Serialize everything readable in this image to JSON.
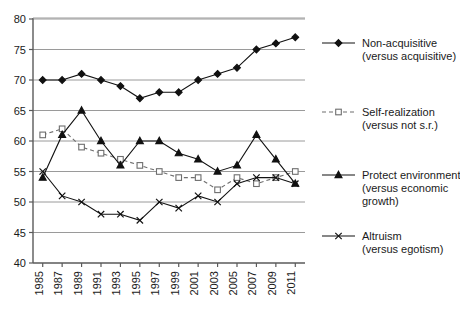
{
  "chart_data": {
    "type": "line",
    "title": "",
    "xlabel": "",
    "ylabel": "",
    "ylim": [
      40,
      80
    ],
    "ytick_step": 5,
    "yticks": [
      40,
      45,
      50,
      55,
      60,
      65,
      70,
      75,
      80
    ],
    "grid": true,
    "legend_position": "right",
    "categories": [
      1985,
      1987,
      1989,
      1991,
      1993,
      1995,
      1997,
      1999,
      2001,
      2003,
      2005,
      2007,
      2009,
      2011
    ],
    "xtick_labels": [
      "1985",
      "1987",
      "1989",
      "1991",
      "1993",
      "1995",
      "1997",
      "1999",
      "2001",
      "2003",
      "2005",
      "2007",
      "2009",
      "2011"
    ],
    "series": [
      {
        "name": "Non-acquisitive",
        "sublabel": "(versus acquisitive)",
        "marker": "filled-diamond",
        "linestyle": "solid",
        "color": "#111111",
        "values": [
          70,
          70,
          71,
          70,
          69,
          67,
          68,
          68,
          70,
          71,
          72,
          75,
          76,
          77
        ]
      },
      {
        "name": "Self-realization",
        "sublabel": "(versus not s.r.)",
        "marker": "open-square",
        "linestyle": "dashed",
        "color": "#6e6e6e",
        "values": [
          61,
          62,
          59,
          58,
          57,
          56,
          55,
          54,
          54,
          52,
          54,
          53,
          54,
          55
        ]
      },
      {
        "name": "Protect environment",
        "sublabel": "(versus economic growth)",
        "marker": "filled-triangle",
        "linestyle": "solid",
        "color": "#111111",
        "values": [
          54,
          61,
          65,
          60,
          56,
          60,
          60,
          58,
          57,
          55,
          56,
          61,
          57,
          53
        ]
      },
      {
        "name": "Altruism",
        "sublabel": "(versus egotism)",
        "marker": "cross-x",
        "linestyle": "solid",
        "color": "#111111",
        "values": [
          55,
          51,
          50,
          48,
          48,
          47,
          50,
          49,
          51,
          50,
          53,
          54,
          54,
          53
        ]
      }
    ]
  },
  "legend": {
    "items": [
      {
        "label": "Non-acquisitive",
        "sub": "(versus acquisitive)"
      },
      {
        "label": "Self-realization",
        "sub": "(versus not s.r.)"
      },
      {
        "label": "Protect environment",
        "sub": "(versus economic",
        "sub2": "growth)"
      },
      {
        "label": "Altruism",
        "sub": "(versus egotism)"
      }
    ]
  }
}
